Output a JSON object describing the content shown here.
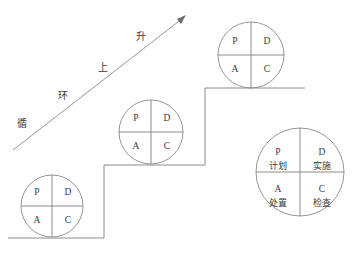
{
  "diagram": {
    "colors": {
      "stroke": "#808080",
      "circle_stroke": "#8a8a8a",
      "text": "#3a3a3a",
      "background": "#ffffff"
    },
    "ascending_arrow": {
      "labels": [
        {
          "text": "循",
          "x": 22,
          "y": 124
        },
        {
          "text": "环",
          "x": 63,
          "y": 96
        },
        {
          "text": "上",
          "x": 103,
          "y": 68
        },
        {
          "text": "升",
          "x": 141,
          "y": 37
        }
      ],
      "line": {
        "x1": 13,
        "y1": 150,
        "x2": 183,
        "y2": 18
      },
      "arrow_tip": {
        "x": 186,
        "y": 15
      }
    },
    "staircase": {
      "segments": [
        {
          "type": "horizontal",
          "x1": 8,
          "y1": 238,
          "x2": 104,
          "y2": 238
        },
        {
          "type": "vertical",
          "x1": 104,
          "y1": 238,
          "x2": 104,
          "y2": 165
        },
        {
          "type": "horizontal",
          "x1": 104,
          "y1": 165,
          "x2": 205,
          "y2": 165
        },
        {
          "type": "vertical",
          "x1": 205,
          "y1": 165,
          "x2": 205,
          "y2": 88
        },
        {
          "type": "horizontal",
          "x1": 205,
          "y1": 88,
          "x2": 305,
          "y2": 88
        }
      ]
    },
    "circles": [
      {
        "name": "pdca-circle-bottom",
        "cx": 52,
        "cy": 206,
        "r": 31,
        "quadrants": [
          {
            "position": "top-left",
            "letter": "P",
            "cjk": ""
          },
          {
            "position": "top-right",
            "letter": "D",
            "cjk": ""
          },
          {
            "position": "bottom-left",
            "letter": "A",
            "cjk": ""
          },
          {
            "position": "bottom-right",
            "letter": "C",
            "cjk": ""
          }
        ]
      },
      {
        "name": "pdca-circle-middle",
        "cx": 151,
        "cy": 132,
        "r": 32,
        "quadrants": [
          {
            "position": "top-left",
            "letter": "P",
            "cjk": ""
          },
          {
            "position": "top-right",
            "letter": "D",
            "cjk": ""
          },
          {
            "position": "bottom-left",
            "letter": "A",
            "cjk": ""
          },
          {
            "position": "bottom-right",
            "letter": "C",
            "cjk": ""
          }
        ]
      },
      {
        "name": "pdca-circle-top",
        "cx": 251,
        "cy": 55,
        "r": 33,
        "quadrants": [
          {
            "position": "top-left",
            "letter": "P",
            "cjk": ""
          },
          {
            "position": "top-right",
            "letter": "D",
            "cjk": ""
          },
          {
            "position": "bottom-left",
            "letter": "A",
            "cjk": ""
          },
          {
            "position": "bottom-right",
            "letter": "C",
            "cjk": ""
          }
        ]
      },
      {
        "name": "pdca-circle-legend",
        "cx": 300,
        "cy": 172,
        "r": 44,
        "quadrants": [
          {
            "position": "top-left",
            "letter": "P",
            "cjk": "计划"
          },
          {
            "position": "top-right",
            "letter": "D",
            "cjk": "实施"
          },
          {
            "position": "bottom-left",
            "letter": "A",
            "cjk": "处置"
          },
          {
            "position": "bottom-right",
            "letter": "C",
            "cjk": "检查"
          }
        ]
      }
    ]
  }
}
